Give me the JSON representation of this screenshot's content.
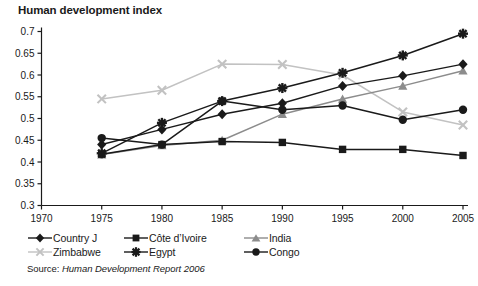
{
  "chart_data": {
    "type": "line",
    "title": "Human development index",
    "xlabel": "",
    "ylabel": "",
    "xlim": [
      1970,
      2005
    ],
    "ylim": [
      0.3,
      0.7
    ],
    "grid": false,
    "legend_position": "below-plot",
    "x": [
      1975,
      1980,
      1985,
      1990,
      1995,
      2000,
      2005
    ],
    "xticks": [
      "1970",
      "1975",
      "1980",
      "1985",
      "1990",
      "1995",
      "2000",
      "2005"
    ],
    "yticks": [
      "0.3",
      "0.35",
      "0.4",
      "0.45",
      "0.5",
      "0.55",
      "0.6",
      "0.65",
      "0.7"
    ],
    "series": [
      {
        "name": "Country J",
        "marker": "diamond",
        "color": "#1a1a1a",
        "values": [
          0.44,
          0.475,
          0.51,
          0.535,
          0.575,
          0.598,
          0.625
        ]
      },
      {
        "name": "Côte d’Ivoire",
        "marker": "square",
        "color": "#1a1a1a",
        "values": [
          0.418,
          0.44,
          0.447,
          0.445,
          0.429,
          0.429,
          0.415
        ]
      },
      {
        "name": "India",
        "marker": "triangle",
        "color": "#8c8c8c",
        "values": [
          0.417,
          0.438,
          0.45,
          0.51,
          0.545,
          0.575,
          0.61
        ]
      },
      {
        "name": "Zimbabwe",
        "marker": "x",
        "color": "#c2c2c2",
        "values": [
          0.545,
          0.565,
          0.625,
          0.624,
          0.6,
          0.515,
          0.485
        ]
      },
      {
        "name": "Egypt",
        "marker": "asterisk",
        "color": "#1a1a1a",
        "values": [
          0.42,
          0.49,
          0.54,
          0.57,
          0.605,
          0.645,
          0.695
        ]
      },
      {
        "name": "Congo",
        "marker": "circle",
        "color": "#1a1a1a",
        "values": [
          0.455,
          0.44,
          0.54,
          0.52,
          0.53,
          0.497,
          0.52
        ]
      }
    ],
    "source": {
      "prefix": "Source: ",
      "text": "Human Development Report 2006"
    }
  }
}
